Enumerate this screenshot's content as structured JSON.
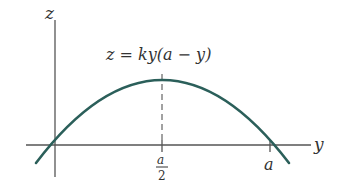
{
  "diagram": {
    "axis_labels": {
      "vertical": "z",
      "horizontal": "y"
    },
    "equation": "z = ky(a − y)",
    "tick_labels": {
      "midpoint_num": "a",
      "midpoint_den": "2",
      "root": "a"
    },
    "colors": {
      "curve": "#2b5f5a",
      "axes": "#555555",
      "text": "#333333"
    }
  }
}
